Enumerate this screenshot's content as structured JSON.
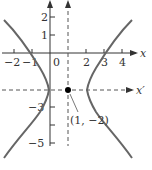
{
  "diagram": {
    "type": "hyperbola-translated-axes",
    "axes": {
      "x": {
        "label": "x",
        "ticks": [
          "−2",
          "−1",
          "0",
          "2",
          "3",
          "4"
        ]
      },
      "y": {
        "label": "y",
        "ticks": [
          "2",
          "1",
          "−3",
          "−5"
        ]
      },
      "x_prime": {
        "label": "x′",
        "style": "dashed"
      },
      "y_prime": {
        "label": "y′",
        "style": "dashed"
      }
    },
    "center": {
      "label": "(1, −2)",
      "x": 1,
      "y": -2
    },
    "vertices": [
      [
        -1,
        -2
      ],
      [
        3,
        -2
      ]
    ],
    "colors": {
      "curve": "#666666",
      "axis": "#333333",
      "point": "#000000"
    }
  }
}
